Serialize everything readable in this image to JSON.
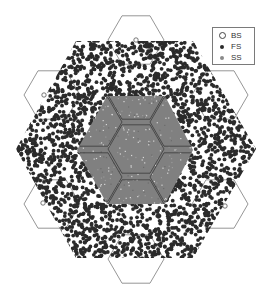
{
  "chart_data": {
    "type": "scatter",
    "title": "",
    "xlabel": "",
    "ylabel": "",
    "grid": false,
    "legend_position": "upper right",
    "legend": [
      {
        "label": "BS",
        "marker": "open-circle",
        "color": "#444444"
      },
      {
        "label": "FS",
        "marker": "filled-circle",
        "color": "#2b2b2b"
      },
      {
        "label": "SS",
        "marker": "filled-circle",
        "color": "#8a8a8a"
      }
    ],
    "layout": "hexagonal cellular grid, flat-top hexagons",
    "cells": {
      "hex_radius_px": 28,
      "center_cell": [
        136,
        149
      ],
      "ring1_cells": [
        [
          136,
          95
        ],
        [
          178,
          122
        ],
        [
          178,
          177
        ],
        [
          136,
          204
        ],
        [
          94,
          177
        ],
        [
          94,
          122
        ]
      ],
      "ring2_outline_cells": [
        [
          136,
          40
        ],
        [
          220,
          95
        ],
        [
          220,
          204
        ],
        [
          136,
          259
        ],
        [
          52,
          204
        ],
        [
          52,
          95
        ]
      ]
    },
    "regions": {
      "SS_region_polygon": [
        [
          77,
          150
        ],
        [
          107,
          96
        ],
        [
          165,
          96
        ],
        [
          193,
          150
        ],
        [
          165,
          204
        ],
        [
          107,
          204
        ]
      ],
      "FS_region_polygon": [
        [
          76,
          41
        ],
        [
          193,
          41
        ],
        [
          256,
          149
        ],
        [
          193,
          258
        ],
        [
          76,
          258
        ],
        [
          16,
          149
        ]
      ]
    },
    "series": [
      {
        "name": "BS",
        "points": [
          [
            136,
            40
          ],
          [
            44,
            95
          ],
          [
            43,
            203
          ],
          [
            225,
            206
          ]
        ]
      },
      {
        "name": "FS",
        "description": "dense cloud of user points filling FS region outside SS region",
        "approx_count": 3000
      },
      {
        "name": "SS",
        "description": "dense cloud filling central SS region (center cell + partial ring 1)",
        "approx_count": 3000
      }
    ]
  },
  "legend": {
    "items": [
      {
        "label": "BS"
      },
      {
        "label": "FS"
      },
      {
        "label": "SS"
      }
    ]
  },
  "colors": {
    "fs": "#2b2b2b",
    "ss": "#808080",
    "hex_line": "#888888",
    "inner_line": "#3a3a3a",
    "background": "#ffffff"
  }
}
